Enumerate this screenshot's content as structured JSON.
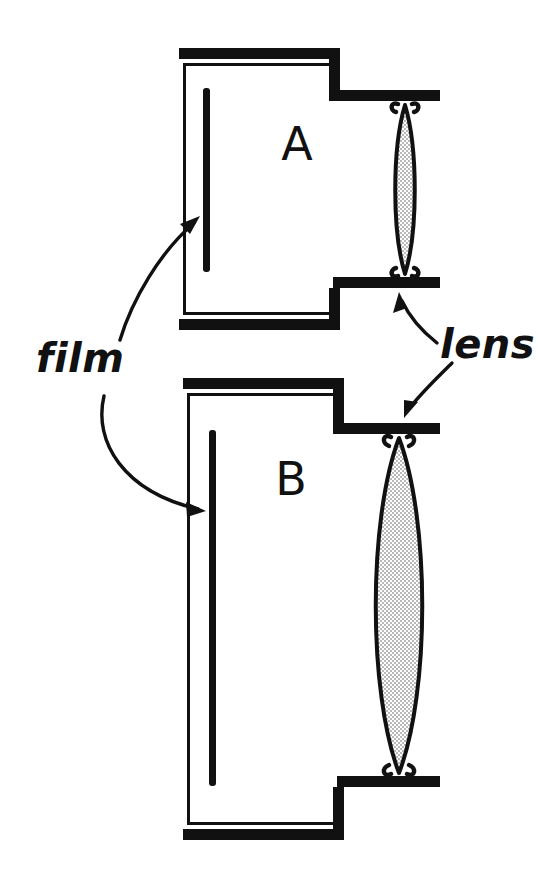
{
  "figure": {
    "ink_color": "#111111",
    "background_color": "#ffffff",
    "lens_fill_color": "#d9d9d9"
  },
  "labels": {
    "film": "film",
    "lens": "lens"
  },
  "cameras": [
    {
      "id": "A",
      "letter": "A",
      "letter_x": 297,
      "letter_y": 160,
      "body": {
        "outer_x": 168,
        "outer_y": 48,
        "outer_w": 172,
        "outer_h": 282,
        "wall_thickness": 5,
        "wall_gap": 7
      },
      "film": {
        "x": 206,
        "y_top": 88,
        "y_bottom": 272,
        "thickness": 7
      },
      "lens": {
        "center_x": 405,
        "top_y": 103,
        "bottom_y": 276,
        "half_width": 14,
        "aperture_label": "small"
      },
      "lens_boards": [
        {
          "position": "top",
          "y": 92,
          "x_left": 327,
          "x_right": 432,
          "thickness": 11
        },
        {
          "position": "bottom",
          "y": 277,
          "x_left": 333,
          "x_right": 438,
          "thickness": 11
        }
      ]
    },
    {
      "id": "B",
      "letter": "B",
      "letter_x": 291,
      "letter_y": 495,
      "body": {
        "outer_x": 172,
        "outer_y": 378,
        "outer_w": 172,
        "outer_h": 462,
        "wall_thickness": 5,
        "wall_gap": 7
      },
      "film": {
        "x": 212,
        "y_top": 430,
        "y_bottom": 786,
        "thickness": 7
      },
      "lens": {
        "center_x": 399,
        "top_y": 437,
        "bottom_y": 775,
        "half_width": 32,
        "aperture_label": "large"
      },
      "lens_boards": [
        {
          "position": "top",
          "y": 425,
          "x_left": 331,
          "x_right": 436,
          "thickness": 11
        },
        {
          "position": "bottom",
          "y": 776,
          "x_left": 337,
          "x_right": 438,
          "thickness": 11
        }
      ]
    }
  ],
  "leaders": [
    {
      "name": "film-to-camera-a",
      "from_label": "film",
      "to_target": "camera-A-film",
      "path": "M 120 340 C 132 300 160 252 196 222",
      "arrow_tip": [
        200,
        218
      ],
      "arrow_angle": -40
    },
    {
      "name": "film-to-camera-b",
      "from_label": "film",
      "to_target": "camera-B-film",
      "path": "M 104 396 C 96 440 126 490 200 508",
      "arrow_tip": [
        206,
        510
      ],
      "arrow_angle": 16
    },
    {
      "name": "lens-to-camera-a",
      "from_label": "lens",
      "to_target": "camera-A-lens-board",
      "path": "M 437 343 C 423 332 410 318 402 300",
      "arrow_tip": [
        399,
        294
      ],
      "arrow_angle": -115
    },
    {
      "name": "lens-to-camera-b",
      "from_label": "lens",
      "to_target": "camera-B-lens-board",
      "path": "M 452 363 C 436 378 420 394 408 410",
      "arrow_tip": [
        404,
        416
      ],
      "arrow_angle": 128
    }
  ],
  "label_positions": {
    "film": {
      "x": 36,
      "y": 372
    },
    "lens": {
      "x": 440,
      "y": 358
    }
  }
}
